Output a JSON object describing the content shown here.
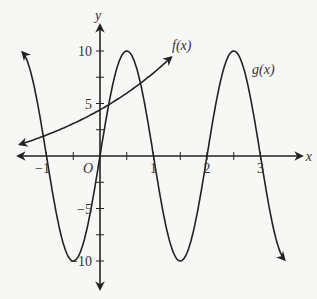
{
  "chart_data": {
    "type": "line",
    "title": "",
    "xlabel": "x",
    "ylabel": "y",
    "origin_label": "O",
    "xlim": [
      -1.5,
      3.3
    ],
    "ylim": [
      -12,
      13
    ],
    "x_ticks": [
      -1,
      -0.5,
      0.5,
      1,
      1.5,
      2,
      2.5,
      3
    ],
    "x_tick_labels": [
      {
        "v": -1,
        "t": "−1"
      },
      {
        "v": 1,
        "t": "1"
      },
      {
        "v": 2,
        "t": "2"
      },
      {
        "v": 3,
        "t": "3"
      }
    ],
    "y_ticks": [
      -10,
      -7.5,
      -5,
      -2.5,
      2.5,
      5,
      7.5,
      10
    ],
    "y_tick_labels": [
      {
        "v": 10,
        "t": "10"
      },
      {
        "v": 5,
        "t": "5"
      },
      {
        "v": -5,
        "t": "−5"
      },
      {
        "v": -10,
        "t": "−10"
      }
    ],
    "grid": false,
    "series": [
      {
        "name": "f(x)",
        "label": "f(x)",
        "x": [
          -1.5,
          -1,
          -0.5,
          0,
          0.5,
          1,
          1.3
        ],
        "y": [
          0.1,
          1.2,
          2.6,
          4.4,
          6.6,
          9.3,
          11.2
        ]
      },
      {
        "name": "g(x)",
        "label": "g(x)",
        "x": [
          -1.45,
          -1,
          -0.5,
          0,
          0.5,
          1,
          1.5,
          2,
          2.5,
          3,
          3.45
        ],
        "y": [
          9.9,
          0,
          -10,
          0,
          10,
          0,
          -10,
          0,
          10,
          0,
          -9.9
        ]
      }
    ],
    "labels": {
      "f": "f(x)",
      "g": "g(x)",
      "x_axis": "x",
      "y_axis": "y",
      "origin": "O"
    }
  }
}
